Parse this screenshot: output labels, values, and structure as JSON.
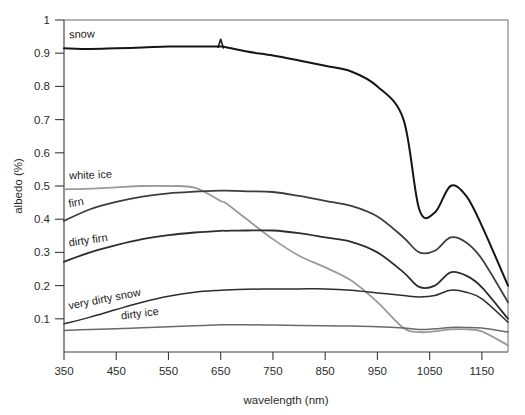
{
  "chart_data": {
    "type": "line",
    "title": "",
    "xlabel": "wavelength (nm)",
    "ylabel": "albedo (%)",
    "xlim": [
      350,
      1200
    ],
    "ylim": [
      0,
      1
    ],
    "grid": false,
    "legend_position": "inline-labels",
    "xticks": [
      350,
      450,
      550,
      650,
      750,
      850,
      950,
      1050,
      1150
    ],
    "xtick_labels": [
      "350",
      "450",
      "550",
      "650",
      "750",
      "850",
      "950",
      "1050",
      "1150"
    ],
    "yticks": [
      0.1,
      0.2,
      0.3,
      0.4,
      0.5,
      0.6,
      0.7,
      0.8,
      0.9,
      1
    ],
    "ytick_labels": [
      "0.1",
      "0.2",
      "0.3",
      "0.4",
      "0.5",
      "0.6",
      "0.7",
      "0.8",
      "0.9",
      "1"
    ],
    "x": [
      350,
      400,
      450,
      500,
      550,
      600,
      650,
      660,
      700,
      750,
      800,
      850,
      900,
      950,
      1000,
      1030,
      1060,
      1090,
      1120,
      1150,
      1200
    ],
    "series": [
      {
        "name": "snow",
        "color": "#151515",
        "width": 2.0,
        "values": [
          0.915,
          0.913,
          0.915,
          0.917,
          0.92,
          0.92,
          0.92,
          0.918,
          0.905,
          0.893,
          0.878,
          0.862,
          0.845,
          0.8,
          0.7,
          0.43,
          0.42,
          0.5,
          0.47,
          0.38,
          0.2
        ]
      },
      {
        "name": "white ice",
        "color": "#9a9a9a",
        "width": 1.8,
        "values": [
          0.49,
          0.492,
          0.496,
          0.5,
          0.5,
          0.495,
          0.455,
          0.448,
          0.4,
          0.34,
          0.29,
          0.255,
          0.215,
          0.15,
          0.072,
          0.06,
          0.062,
          0.068,
          0.068,
          0.062,
          0.02
        ]
      },
      {
        "name": "firn",
        "color": "#3d3d3d",
        "width": 1.8,
        "values": [
          0.395,
          0.43,
          0.452,
          0.468,
          0.478,
          0.483,
          0.486,
          0.486,
          0.484,
          0.482,
          0.47,
          0.455,
          0.44,
          0.408,
          0.345,
          0.3,
          0.305,
          0.345,
          0.33,
          0.28,
          0.15
        ]
      },
      {
        "name": "dirty firn",
        "color": "#2d2d2d",
        "width": 1.8,
        "values": [
          0.272,
          0.3,
          0.322,
          0.34,
          0.352,
          0.36,
          0.365,
          0.365,
          0.366,
          0.366,
          0.358,
          0.345,
          0.332,
          0.3,
          0.24,
          0.196,
          0.2,
          0.24,
          0.23,
          0.195,
          0.1
        ]
      },
      {
        "name": "very dirty snow",
        "color": "#2d2d2d",
        "width": 1.5,
        "values": [
          0.085,
          0.105,
          0.128,
          0.15,
          0.168,
          0.18,
          0.186,
          0.187,
          0.189,
          0.19,
          0.19,
          0.19,
          0.186,
          0.178,
          0.17,
          0.166,
          0.17,
          0.186,
          0.18,
          0.16,
          0.09
        ]
      },
      {
        "name": "dirty ice",
        "color": "#6a6a6a",
        "width": 1.5,
        "values": [
          0.065,
          0.068,
          0.07,
          0.073,
          0.076,
          0.079,
          0.082,
          0.082,
          0.082,
          0.081,
          0.08,
          0.079,
          0.078,
          0.076,
          0.072,
          0.068,
          0.07,
          0.074,
          0.074,
          0.072,
          0.06
        ]
      }
    ],
    "annotations": [
      {
        "text": "snow",
        "x": 360,
        "y": 0.945,
        "rotation": -2
      },
      {
        "text": "white ice",
        "x": 360,
        "y": 0.52,
        "rotation": -2
      },
      {
        "text": "firn",
        "x": 360,
        "y": 0.435,
        "rotation": -11
      },
      {
        "text": "dirty firn",
        "x": 360,
        "y": 0.318,
        "rotation": -8
      },
      {
        "text": "very dirty snow",
        "x": 360,
        "y": 0.128,
        "rotation": -11
      },
      {
        "text": "dirty ice",
        "x": 460,
        "y": 0.098,
        "rotation": -7
      }
    ]
  }
}
